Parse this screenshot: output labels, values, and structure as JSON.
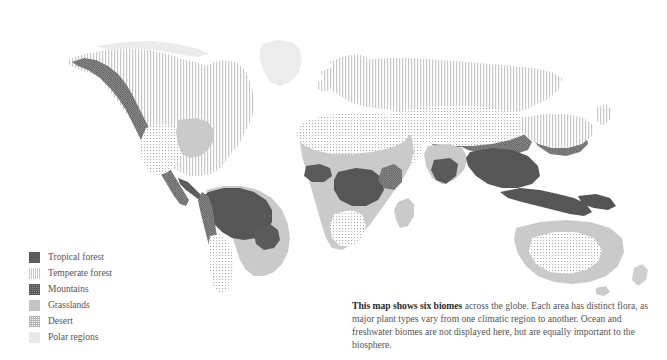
{
  "page": {
    "background": "#ffffff",
    "width": 667,
    "height": 360
  },
  "map": {
    "name": "world-biomes-map",
    "projection": "world",
    "style": "grayscale-pattern-fill",
    "ocean_color": "#ffffff"
  },
  "legend": {
    "title": "",
    "items": [
      {
        "label": "Tropical forest",
        "swatch": "solid-dark",
        "color": "#5c5c5c",
        "pattern": "solid"
      },
      {
        "label": "Temperate forest",
        "swatch": "vertical-stripes",
        "color": "#c9c9c9",
        "pattern": "vertical-lines"
      },
      {
        "label": "Mountains",
        "swatch": "dark-checkered",
        "color": "#5a5a5a",
        "pattern": "cross-hatch-dots"
      },
      {
        "label": "Grasslands",
        "swatch": "solid-mid-gray",
        "color": "#c4c4c4",
        "pattern": "solid"
      },
      {
        "label": "Desert",
        "swatch": "fine-dot-grid",
        "color": "#b4b4b4",
        "pattern": "dot-grid"
      },
      {
        "label": "Polar regions",
        "swatch": "solid-very-light",
        "color": "#e9e9e9",
        "pattern": "solid"
      }
    ]
  },
  "caption": {
    "lead": "This map shows six biomes",
    "body": " across the globe. Each area has distinct flora, as major plant types vary from one climatic region to another. Ocean and freshwater biomes are not displayed here, but are equally important to the biosphere.",
    "text_color": "#555555",
    "lead_color": "#2b2b2b"
  },
  "biome_regions": [
    {
      "region": "North America - Canada and United States",
      "biome": "Temperate forest"
    },
    {
      "region": "North America - Pacific cordillera",
      "biome": "Mountains"
    },
    {
      "region": "North America - Southwest United States and northern Mexico",
      "biome": "Desert"
    },
    {
      "region": "Greenland and Arctic islands",
      "biome": "Polar regions"
    },
    {
      "region": "Central America and Caribbean",
      "biome": "Tropical forest"
    },
    {
      "region": "South America - Amazon basin",
      "biome": "Tropical forest"
    },
    {
      "region": "South America - Andes",
      "biome": "Mountains"
    },
    {
      "region": "South America - Cerrado, Pampas, Gran Chaco",
      "biome": "Grasslands"
    },
    {
      "region": "South America - Atacama and Patagonia",
      "biome": "Desert"
    },
    {
      "region": "Europe and Siberia",
      "biome": "Temperate forest"
    },
    {
      "region": "Africa - Sahara",
      "biome": "Desert"
    },
    {
      "region": "Africa - Sahel and savanna",
      "biome": "Grasslands"
    },
    {
      "region": "Africa - Congo basin and Gulf of Guinea",
      "biome": "Tropical forest"
    },
    {
      "region": "Africa - Kalahari and Namib",
      "biome": "Desert"
    },
    {
      "region": "Africa - East African highlands",
      "biome": "Mountains"
    },
    {
      "region": "Arabia, Iran and Central Asia",
      "biome": "Desert"
    },
    {
      "region": "Himalaya and Tibetan plateau",
      "biome": "Mountains"
    },
    {
      "region": "India and Southeast Asia",
      "biome": "Tropical forest"
    },
    {
      "region": "Indonesia and New Guinea",
      "biome": "Tropical forest"
    },
    {
      "region": "East Asia - China, Korea, Japan",
      "biome": "Temperate forest"
    },
    {
      "region": "Australia - interior",
      "biome": "Desert"
    },
    {
      "region": "Australia - coastal margins",
      "biome": "Grasslands"
    }
  ]
}
